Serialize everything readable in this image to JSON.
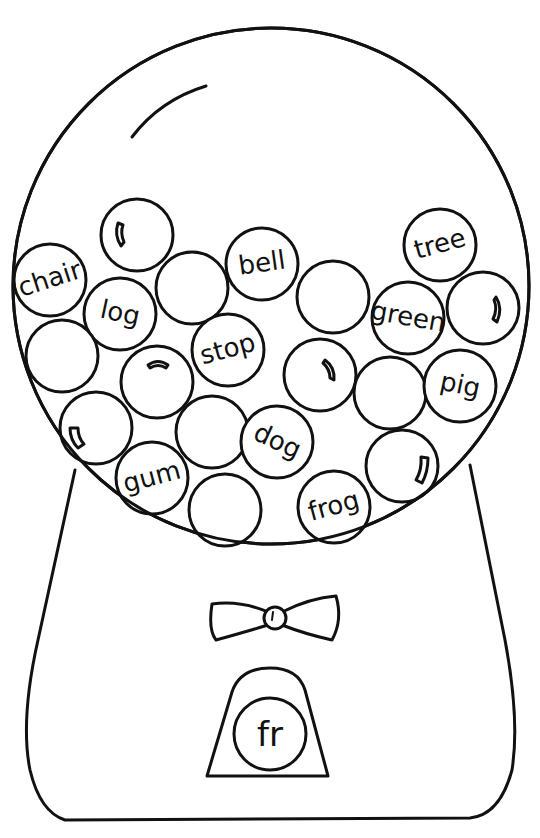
{
  "worksheet": {
    "title": "Gumball machine word sort",
    "target_blend": "fr",
    "colors": {
      "ink": "#111111",
      "paper": "#ffffff"
    },
    "gumballs": [
      {
        "word": "chair",
        "x": 50,
        "y": 280,
        "r": 36,
        "rot": -18
      },
      {
        "word": "",
        "x": 137,
        "y": 235,
        "r": 36,
        "rot": 0,
        "highlight": true
      },
      {
        "word": "log",
        "x": 120,
        "y": 314,
        "r": 36,
        "rot": 12
      },
      {
        "word": "",
        "x": 192,
        "y": 288,
        "r": 36,
        "rot": 0
      },
      {
        "word": "bell",
        "x": 262,
        "y": 264,
        "r": 36,
        "rot": -8
      },
      {
        "word": "",
        "x": 333,
        "y": 297,
        "r": 36,
        "rot": 0
      },
      {
        "word": "tree",
        "x": 440,
        "y": 245,
        "r": 36,
        "rot": -15
      },
      {
        "word": "green",
        "x": 408,
        "y": 318,
        "r": 36,
        "rot": 10
      },
      {
        "word": "",
        "x": 483,
        "y": 308,
        "r": 36,
        "rot": 0,
        "highlight": true
      },
      {
        "word": "",
        "x": 62,
        "y": 356,
        "r": 36,
        "rot": 0
      },
      {
        "word": "",
        "x": 157,
        "y": 382,
        "r": 36,
        "rot": 0,
        "highlight": true
      },
      {
        "word": "stop",
        "x": 228,
        "y": 350,
        "r": 36,
        "rot": -15
      },
      {
        "word": "",
        "x": 320,
        "y": 375,
        "r": 36,
        "rot": 0,
        "highlight": true
      },
      {
        "word": "",
        "x": 390,
        "y": 393,
        "r": 36,
        "rot": 0
      },
      {
        "word": "pig",
        "x": 460,
        "y": 386,
        "r": 36,
        "rot": 12
      },
      {
        "word": "",
        "x": 96,
        "y": 428,
        "r": 36,
        "rot": 0,
        "highlight": true
      },
      {
        "word": "",
        "x": 212,
        "y": 432,
        "r": 36,
        "rot": 0
      },
      {
        "word": "dog",
        "x": 277,
        "y": 442,
        "r": 36,
        "rot": 25
      },
      {
        "word": "",
        "x": 402,
        "y": 466,
        "r": 36,
        "rot": 0,
        "highlight": true
      },
      {
        "word": "gum",
        "x": 152,
        "y": 478,
        "r": 36,
        "rot": -15
      },
      {
        "word": "",
        "x": 225,
        "y": 510,
        "r": 36,
        "rot": 0
      },
      {
        "word": "frog",
        "x": 334,
        "y": 507,
        "r": 36,
        "rot": -15
      }
    ]
  },
  "labels": {
    "w0": "chair",
    "w2": "log",
    "w4": "bell",
    "w6": "tree",
    "w7": "green",
    "w11": "stop",
    "w14": "pig",
    "w17": "dog",
    "w19": "gum",
    "w21": "frog",
    "chute": "fr"
  }
}
